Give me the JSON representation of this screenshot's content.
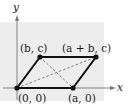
{
  "diagram": {
    "type": "parallelogram-on-axes",
    "axes": {
      "x_label": "x",
      "y_label": "y"
    },
    "vertices": [
      {
        "name": "origin",
        "label": "(0, 0)"
      },
      {
        "name": "a-zero",
        "label": "(a, 0)"
      },
      {
        "name": "b-c",
        "label": "(b, c)"
      },
      {
        "name": "a-plus-b-c",
        "label": "(a + b, c)"
      }
    ],
    "diagonals": "dashed",
    "colors": {
      "background_panel": "#ededed",
      "stroke": "#111111",
      "diagonal": "#666666",
      "axis": "#777777"
    }
  }
}
